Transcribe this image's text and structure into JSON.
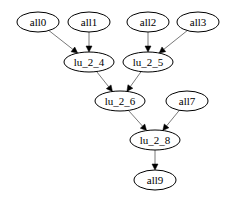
{
  "graph": {
    "nodes": [
      {
        "id": "all0",
        "label": "all0",
        "cx": 38,
        "cy": 22,
        "rx": 21,
        "ry": 10
      },
      {
        "id": "all1",
        "label": "all1",
        "cx": 89,
        "cy": 22,
        "rx": 21,
        "ry": 10
      },
      {
        "id": "all2",
        "label": "all2",
        "cx": 148,
        "cy": 22,
        "rx": 21,
        "ry": 10
      },
      {
        "id": "all3",
        "label": "all3",
        "cx": 198,
        "cy": 22,
        "rx": 21,
        "ry": 10
      },
      {
        "id": "lu_2_4",
        "label": "lu_2_4",
        "cx": 89,
        "cy": 62,
        "rx": 25,
        "ry": 10
      },
      {
        "id": "lu_2_5",
        "label": "lu_2_5",
        "cx": 148,
        "cy": 62,
        "rx": 25,
        "ry": 10
      },
      {
        "id": "lu_2_6",
        "label": "lu_2_6",
        "cx": 120,
        "cy": 101,
        "rx": 25,
        "ry": 10
      },
      {
        "id": "all7",
        "label": "all7",
        "cx": 187,
        "cy": 101,
        "rx": 21,
        "ry": 10
      },
      {
        "id": "lu_2_8",
        "label": "lu_2_8",
        "cx": 155,
        "cy": 140,
        "rx": 25,
        "ry": 10
      },
      {
        "id": "all9",
        "label": "all9",
        "cx": 155,
        "cy": 180,
        "rx": 21,
        "ry": 10
      }
    ],
    "edges": [
      {
        "from": "all0",
        "to": "lu_2_4"
      },
      {
        "from": "all1",
        "to": "lu_2_4"
      },
      {
        "from": "all2",
        "to": "lu_2_5"
      },
      {
        "from": "all3",
        "to": "lu_2_5"
      },
      {
        "from": "lu_2_4",
        "to": "lu_2_6"
      },
      {
        "from": "lu_2_5",
        "to": "lu_2_6"
      },
      {
        "from": "lu_2_6",
        "to": "lu_2_8"
      },
      {
        "from": "all7",
        "to": "lu_2_8"
      },
      {
        "from": "lu_2_8",
        "to": "all9"
      }
    ]
  }
}
